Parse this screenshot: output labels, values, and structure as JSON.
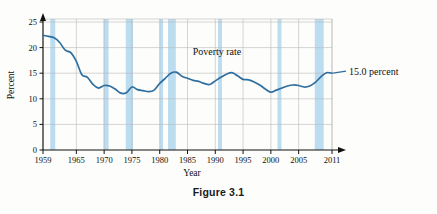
{
  "figure": {
    "caption": "Figure 3.1"
  },
  "chart_data": {
    "type": "line",
    "title": "",
    "xlabel": "Year",
    "ylabel": "Percent",
    "xlim": [
      1959,
      2011
    ],
    "ylim": [
      0,
      25
    ],
    "grid": true,
    "legend_position": "inline-annotation",
    "xticks": [
      "1959",
      "1965",
      "1970",
      "1975",
      "1980",
      "1985",
      "1990",
      "1995",
      "2000",
      "2005",
      "2011"
    ],
    "xtick_values": [
      1959,
      1965,
      1970,
      1975,
      1980,
      1985,
      1990,
      1995,
      2000,
      2005,
      2011
    ],
    "yticks": [
      "0",
      "5",
      "10",
      "15",
      "20",
      "25"
    ],
    "ytick_values": [
      0,
      5,
      10,
      15,
      20,
      25
    ],
    "series": [
      {
        "name": "Poverty rate",
        "color": "#2f6f9f",
        "x": [
          1959,
          1960,
          1961,
          1962,
          1963,
          1964,
          1965,
          1966,
          1967,
          1968,
          1969,
          1970,
          1971,
          1972,
          1973,
          1974,
          1975,
          1976,
          1977,
          1978,
          1979,
          1980,
          1981,
          1982,
          1983,
          1984,
          1985,
          1986,
          1987,
          1988,
          1989,
          1990,
          1991,
          1992,
          1993,
          1994,
          1995,
          1996,
          1997,
          1998,
          1999,
          2000,
          2001,
          2002,
          2003,
          2004,
          2005,
          2006,
          2007,
          2008,
          2009,
          2010,
          2011
        ],
        "values": [
          22.4,
          22.2,
          21.9,
          21.0,
          19.5,
          19.0,
          17.3,
          14.7,
          14.2,
          12.8,
          12.1,
          12.6,
          12.5,
          11.9,
          11.1,
          11.2,
          12.3,
          11.8,
          11.6,
          11.4,
          11.7,
          13.0,
          14.0,
          15.0,
          15.2,
          14.4,
          14.0,
          13.6,
          13.4,
          13.0,
          12.8,
          13.5,
          14.2,
          14.8,
          15.1,
          14.5,
          13.8,
          13.7,
          13.3,
          12.7,
          11.9,
          11.3,
          11.7,
          12.1,
          12.5,
          12.7,
          12.6,
          12.3,
          12.5,
          13.2,
          14.3,
          15.1,
          15.0
        ]
      }
    ],
    "annotations": [
      {
        "name": "series-label",
        "text": "Poverty rate",
        "x": 1990.3,
        "y": 18.6
      },
      {
        "name": "endpoint-label",
        "text": "15.0 percent",
        "x": 2012.5,
        "y": 15.0
      }
    ],
    "shaded_bands": {
      "name": "recession-bands",
      "color": "#bcdcef",
      "ranges": [
        [
          1960.3,
          1961.2
        ],
        [
          1969.9,
          1970.8
        ],
        [
          1973.9,
          1975.2
        ],
        [
          1980.0,
          1980.6
        ],
        [
          1981.5,
          1982.9
        ],
        [
          1990.5,
          1991.2
        ],
        [
          2001.2,
          2001.9
        ],
        [
          2007.9,
          2009.5
        ]
      ]
    }
  }
}
